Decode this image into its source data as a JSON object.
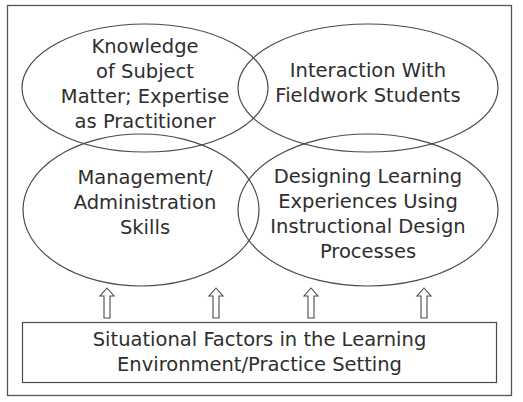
{
  "diagram": {
    "colors": {
      "stroke": "#4a4a4a",
      "text": "#2e2e2e",
      "background": "#ffffff"
    },
    "ellipses": [
      {
        "id": "knowledge",
        "lines": [
          "Knowledge",
          "of Subject",
          "Matter; Expertise",
          "as Practitioner"
        ]
      },
      {
        "id": "interaction",
        "lines": [
          "Interaction With",
          "Fieldwork Students"
        ]
      },
      {
        "id": "management",
        "lines": [
          "Management/",
          "Administration",
          "Skills"
        ]
      },
      {
        "id": "designing",
        "lines": [
          "Designing Learning",
          "Experiences Using",
          "Instructional Design",
          "Processes"
        ]
      }
    ],
    "base_box": {
      "lines": [
        "Situational Factors in the Learning",
        "Environment/Practice Setting"
      ]
    },
    "arrows": [
      {
        "icon": "up-arrow-icon"
      },
      {
        "icon": "up-arrow-icon"
      },
      {
        "icon": "up-arrow-icon"
      },
      {
        "icon": "up-arrow-icon"
      }
    ]
  }
}
